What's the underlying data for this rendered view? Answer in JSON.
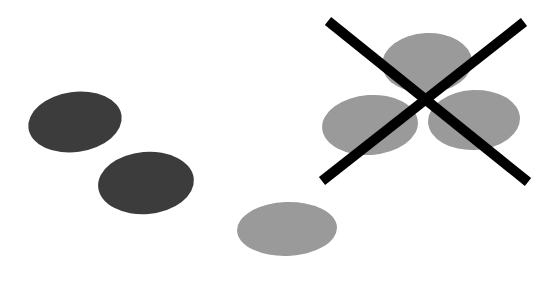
{
  "figure": {
    "width": 536,
    "height": 286,
    "background_color": "#ffffff",
    "colors": {
      "dark_ellipse": "#3c3c3c",
      "light_ellipse": "#9a9a9a",
      "cross_mark": "#000000",
      "background": "#ffffff"
    },
    "groups": [
      {
        "name": "left-pair-group",
        "label": "left dark ellipse pair",
        "marked_out": false
      },
      {
        "name": "bottom-single-group",
        "label": "bottom center light ellipse",
        "marked_out": false
      },
      {
        "name": "crossed-cluster-group",
        "label": "upper right light ellipse cluster",
        "marked_out": true
      }
    ],
    "ellipses": [
      {
        "id": "dark-ellipse-upper-left",
        "group": "left-pair-group",
        "fill": "#3c3c3c",
        "cx": 75,
        "cy": 122,
        "rx": 47,
        "ry": 30,
        "rotation": -8
      },
      {
        "id": "dark-ellipse-lower-left",
        "group": "left-pair-group",
        "fill": "#3c3c3c",
        "cx": 146,
        "cy": 183,
        "rx": 48,
        "ry": 31,
        "rotation": -5
      },
      {
        "id": "light-ellipse-bottom-center",
        "group": "bottom-single-group",
        "fill": "#9a9a9a",
        "cx": 287,
        "cy": 229,
        "rx": 50,
        "ry": 27,
        "rotation": -2
      },
      {
        "id": "light-ellipse-cluster-top",
        "group": "crossed-cluster-group",
        "fill": "#9a9a9a",
        "cx": 427,
        "cy": 63,
        "rx": 45,
        "ry": 30,
        "rotation": -3
      },
      {
        "id": "light-ellipse-cluster-left",
        "group": "crossed-cluster-group",
        "fill": "#9a9a9a",
        "cx": 370,
        "cy": 125,
        "rx": 48,
        "ry": 30,
        "rotation": -4
      },
      {
        "id": "light-ellipse-cluster-right",
        "group": "crossed-cluster-group",
        "fill": "#9a9a9a",
        "cx": 474,
        "cy": 120,
        "rx": 46,
        "ry": 30,
        "rotation": -3
      }
    ],
    "cross_mark": {
      "id": "cross-out-mark",
      "stroke_color": "#000000",
      "stroke_width": 10,
      "strokes": [
        {
          "id": "cross-stroke-down-right",
          "x1": 328,
          "y1": 21,
          "x2": 528,
          "y2": 182
        },
        {
          "id": "cross-stroke-down-left",
          "x1": 524,
          "y1": 22,
          "x2": 322,
          "y2": 181
        }
      ]
    }
  }
}
